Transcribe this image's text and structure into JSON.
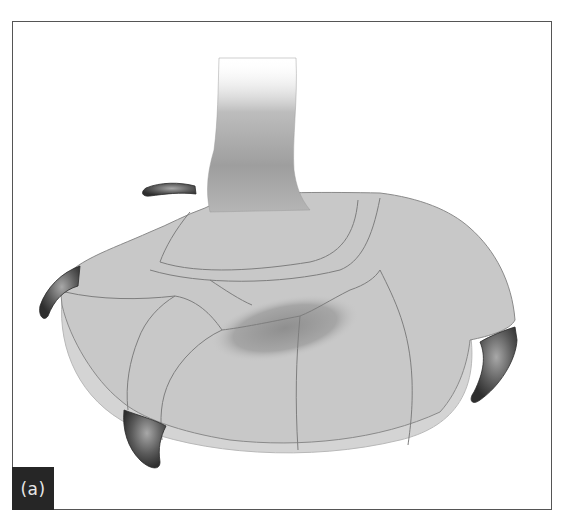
{
  "figure": {
    "panel_label": "(a)",
    "colors": {
      "frame_border": "#555555",
      "label_background": "#262626",
      "label_text": "#e8e8e8",
      "foot_fill": "#c8c8c8",
      "foot_outline": "#8a8a8a",
      "talon_dark": "#3a3a3a",
      "talon_light": "#9a9a9a",
      "shadow": "#9c9c9c"
    },
    "parts": [
      {
        "name": "leg",
        "label": ""
      },
      {
        "name": "toe-pad",
        "label": ""
      },
      {
        "name": "talon-hallux",
        "label": ""
      },
      {
        "name": "talon-left",
        "label": ""
      },
      {
        "name": "talon-front",
        "label": ""
      },
      {
        "name": "talon-right",
        "label": ""
      }
    ]
  }
}
